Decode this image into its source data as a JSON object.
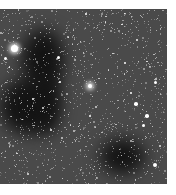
{
  "image": {
    "subject": "star field with dark nebula",
    "palette": {
      "background": "#4a4a4a",
      "dark_nebula": "#141414",
      "star": "#ffffff",
      "page": "#ffffff"
    },
    "frame": {
      "left": 0,
      "top": 9,
      "width": 167,
      "height": 175
    },
    "nebula_regions": [
      {
        "x": 22,
        "y": 20,
        "w": 42,
        "h": 60
      },
      {
        "x": 0,
        "y": 70,
        "w": 55,
        "h": 55
      },
      {
        "x": 30,
        "y": 60,
        "w": 30,
        "h": 65
      },
      {
        "x": 100,
        "y": 130,
        "w": 45,
        "h": 35
      }
    ],
    "bright_stars": [
      {
        "x": 14,
        "y": 48,
        "r": 3.5
      },
      {
        "x": 5,
        "y": 58,
        "r": 1.5
      },
      {
        "x": 90,
        "y": 86,
        "r": 2.2
      },
      {
        "x": 58,
        "y": 57,
        "r": 1.5
      },
      {
        "x": 60,
        "y": 82,
        "r": 1.3
      },
      {
        "x": 136,
        "y": 104,
        "r": 1.8
      },
      {
        "x": 147,
        "y": 116,
        "r": 1.8
      },
      {
        "x": 143,
        "y": 125,
        "r": 1.5
      },
      {
        "x": 155,
        "y": 82,
        "r": 1.5
      },
      {
        "x": 131,
        "y": 93,
        "r": 1.3
      },
      {
        "x": 155,
        "y": 165,
        "r": 2
      },
      {
        "x": 86,
        "y": 14,
        "r": 1.2
      },
      {
        "x": 90,
        "y": 116,
        "r": 1.2
      },
      {
        "x": 33,
        "y": 99,
        "r": 1.2
      },
      {
        "x": 125,
        "y": 63,
        "r": 1.3
      }
    ]
  }
}
